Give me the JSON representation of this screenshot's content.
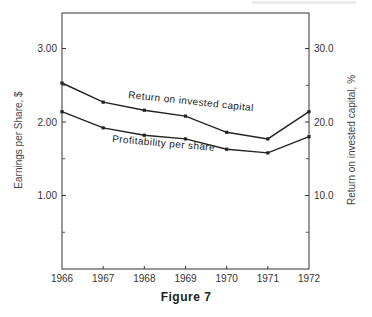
{
  "figure": {
    "caption": "Figure 7",
    "top_faded_text": ""
  },
  "axes": {
    "left_title": "Earnings per Share, $",
    "right_title": "Return on invested capital, %",
    "left_ticks": [
      "3.00",
      "2.00",
      "1.00"
    ],
    "right_ticks": [
      "30.0",
      "20.0",
      "10.0"
    ],
    "x_ticks": [
      "1966",
      "1967",
      "1968",
      "1969",
      "1970",
      "1971",
      "1972"
    ]
  },
  "series_labels": {
    "roic": "Return on invested capital",
    "pps": "Profitability per share"
  },
  "colors": {
    "line": "#222222",
    "frame": "#333333"
  },
  "chart_data": {
    "type": "line",
    "title": "Figure 7",
    "x": [
      1966,
      1967,
      1968,
      1969,
      1970,
      1971,
      1972
    ],
    "xlabel": "",
    "ylabel": "Earnings per Share, $",
    "ylabel_right": "Return on invested capital, %",
    "ylim": [
      0,
      3.65
    ],
    "ylim_right": [
      0,
      36.5
    ],
    "yticks": [
      1.0,
      2.0,
      3.0
    ],
    "yticks_minor": [
      0.5,
      1.5,
      2.5
    ],
    "yticks_right": [
      10.0,
      20.0,
      30.0
    ],
    "grid": false,
    "legend": "inline labels on lines",
    "series": [
      {
        "name": "Return on invested capital",
        "axis": "right",
        "unit": "%",
        "values": [
          25.3,
          22.7,
          21.6,
          20.8,
          18.6,
          17.7,
          21.4
        ]
      },
      {
        "name": "Profitability per share",
        "axis": "left",
        "unit": "$",
        "values": [
          2.14,
          1.92,
          1.82,
          1.77,
          1.63,
          1.58,
          1.8
        ]
      }
    ]
  }
}
